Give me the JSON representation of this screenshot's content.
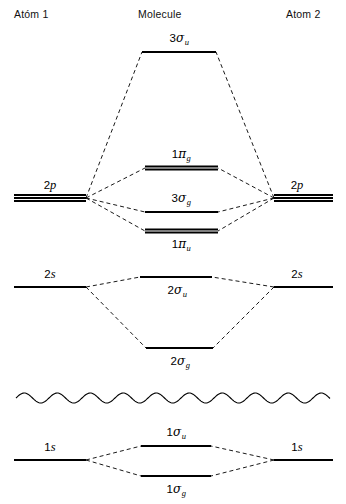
{
  "headers": {
    "atom1": "Atóm 1",
    "molecule": "Molecule",
    "atom2": "Atom 2"
  },
  "diagram": {
    "line_color": "#000000",
    "background": "#ffffff"
  },
  "atomic_levels": [
    {
      "id": "left-2p",
      "label_num": "2",
      "label_orb": "p",
      "label_text": "2p",
      "side": "left",
      "degeneracy": 3,
      "x1": 14,
      "x2": 86,
      "y": 198,
      "label_x": 50,
      "label_y": 178
    },
    {
      "id": "right-2p",
      "label_num": "2",
      "label_orb": "p",
      "label_text": "2p",
      "side": "right",
      "degeneracy": 3,
      "x1": 274,
      "x2": 333,
      "y": 198,
      "label_x": 297,
      "label_y": 178
    },
    {
      "id": "left-2s",
      "label_num": "2",
      "label_orb": "s",
      "label_text": "2s",
      "side": "left",
      "degeneracy": 1,
      "x1": 14,
      "x2": 86,
      "y": 287,
      "label_x": 50,
      "label_y": 267
    },
    {
      "id": "right-2s",
      "label_num": "2",
      "label_orb": "s",
      "label_text": "2s",
      "side": "right",
      "degeneracy": 1,
      "x1": 274,
      "x2": 333,
      "y": 287,
      "label_x": 297,
      "label_y": 267
    },
    {
      "id": "left-1s",
      "label_num": "1",
      "label_orb": "s",
      "label_text": "1s",
      "side": "left",
      "degeneracy": 1,
      "x1": 14,
      "x2": 86,
      "y": 460,
      "label_x": 50,
      "label_y": 440
    },
    {
      "id": "right-1s",
      "label_num": "1",
      "label_orb": "s",
      "label_text": "1s",
      "side": "right",
      "degeneracy": 1,
      "x1": 274,
      "x2": 333,
      "y": 460,
      "label_x": 297,
      "label_y": 440
    }
  ],
  "molecular_levels": [
    {
      "id": "mo-3sigma-u",
      "num": "3",
      "greek": "σ",
      "sub": "u",
      "label_text": "3σu",
      "degeneracy": 1,
      "x1": 142,
      "x2": 216,
      "y": 52,
      "label_x": 179,
      "label_y": 31,
      "label_pos": "above"
    },
    {
      "id": "mo-1pi-g",
      "num": "1",
      "greek": "π",
      "sub": "g",
      "label_text": "1πg",
      "degeneracy": 2,
      "x1": 145,
      "x2": 218,
      "y": 168,
      "label_x": 181,
      "label_y": 147,
      "label_pos": "above"
    },
    {
      "id": "mo-3sigma-g",
      "num": "3",
      "greek": "σ",
      "sub": "g",
      "label_text": "3σg",
      "degeneracy": 1,
      "x1": 145,
      "x2": 218,
      "y": 212,
      "label_x": 181,
      "label_y": 191,
      "label_pos": "above"
    },
    {
      "id": "mo-1pi-u",
      "num": "1",
      "greek": "π",
      "sub": "u",
      "label_text": "1πu",
      "degeneracy": 2,
      "x1": 145,
      "x2": 218,
      "y": 231,
      "label_x": 181,
      "label_y": 237,
      "label_pos": "below"
    },
    {
      "id": "mo-2sigma-u",
      "num": "2",
      "greek": "σ",
      "sub": "u",
      "label_text": "2σu",
      "degeneracy": 1,
      "x1": 140,
      "x2": 212,
      "y": 277,
      "label_x": 177,
      "label_y": 283,
      "label_pos": "below"
    },
    {
      "id": "mo-2sigma-g",
      "num": "2",
      "greek": "σ",
      "sub": "g",
      "label_text": "2σg",
      "degeneracy": 1,
      "x1": 146,
      "x2": 213,
      "y": 348,
      "label_x": 180,
      "label_y": 354,
      "label_pos": "below"
    },
    {
      "id": "mo-1sigma-u",
      "num": "1",
      "greek": "σ",
      "sub": "u",
      "label_text": "1σu",
      "degeneracy": 1,
      "x1": 141,
      "x2": 211,
      "y": 446,
      "label_x": 176,
      "label_y": 425,
      "label_pos": "above"
    },
    {
      "id": "mo-1sigma-g",
      "num": "1",
      "greek": "σ",
      "sub": "g",
      "label_text": "1σg",
      "degeneracy": 1,
      "x1": 141,
      "x2": 211,
      "y": 476,
      "label_x": 176,
      "label_y": 482,
      "label_pos": "below"
    }
  ],
  "break_line": {
    "id": "energy-break-squiggle",
    "x_start": 16,
    "x_end": 330,
    "y": 398,
    "amplitude": 5,
    "wavelength": 33
  },
  "correlations": [
    {
      "from": "left-2p",
      "to": "mo-3sigma-u"
    },
    {
      "from": "left-2p",
      "to": "mo-1pi-g"
    },
    {
      "from": "left-2p",
      "to": "mo-3sigma-g"
    },
    {
      "from": "left-2p",
      "to": "mo-1pi-u"
    },
    {
      "from": "right-2p",
      "to": "mo-3sigma-u"
    },
    {
      "from": "right-2p",
      "to": "mo-1pi-g"
    },
    {
      "from": "right-2p",
      "to": "mo-3sigma-g"
    },
    {
      "from": "right-2p",
      "to": "mo-1pi-u"
    },
    {
      "from": "left-2s",
      "to": "mo-2sigma-u"
    },
    {
      "from": "left-2s",
      "to": "mo-2sigma-g"
    },
    {
      "from": "right-2s",
      "to": "mo-2sigma-u"
    },
    {
      "from": "right-2s",
      "to": "mo-2sigma-g"
    },
    {
      "from": "left-1s",
      "to": "mo-1sigma-u"
    },
    {
      "from": "left-1s",
      "to": "mo-1sigma-g"
    },
    {
      "from": "right-1s",
      "to": "mo-1sigma-u"
    },
    {
      "from": "right-1s",
      "to": "mo-1sigma-g"
    }
  ],
  "chart_data": {
    "type": "diagram",
    "columns": [
      "Atóm 1",
      "Molecule",
      "Atom 2"
    ],
    "atomic_orbitals": [
      "2p",
      "2s",
      "1s"
    ],
    "molecular_orbitals": [
      "3σu",
      "1πg",
      "3σg",
      "1πu",
      "2σu",
      "2σg",
      "1σu",
      "1σg"
    ],
    "ylabel": "Energy"
  }
}
